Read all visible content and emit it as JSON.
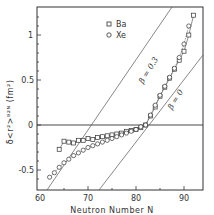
{
  "chart_data": {
    "type": "line",
    "title": "",
    "xlabel": "Neutron Number  N",
    "ylabel": "δ<r²>⁸²ᴺ (fm²)",
    "xlim": [
      60,
      95
    ],
    "ylim": [
      -0.7,
      1.35
    ],
    "x_ticks": [
      60,
      70,
      80,
      90
    ],
    "y_ticks": [
      -0.5,
      0,
      0.5,
      1
    ],
    "x_tick_labels": [
      "60",
      "70",
      "80",
      "90"
    ],
    "y_tick_labels": [
      "-0.5",
      "0",
      "0.5",
      "1"
    ],
    "grid": false,
    "legend_position": "upper left",
    "series": [
      {
        "name": "Ba",
        "marker": "square",
        "x": [
          64,
          65,
          66,
          67,
          68,
          69,
          70,
          71,
          72,
          73,
          74,
          75,
          76,
          77,
          78,
          79,
          80,
          81,
          82,
          83,
          84,
          85,
          86,
          87,
          88,
          89,
          90,
          91,
          92
        ],
        "values": [
          -0.27,
          -0.18,
          -0.19,
          -0.2,
          -0.17,
          -0.17,
          -0.15,
          -0.16,
          -0.14,
          -0.13,
          -0.12,
          -0.11,
          -0.1,
          -0.09,
          -0.07,
          -0.06,
          -0.05,
          -0.03,
          0.0,
          0.1,
          0.2,
          0.32,
          0.42,
          0.52,
          0.62,
          0.72,
          0.82,
          1.0,
          1.22
        ]
      },
      {
        "name": "Xe",
        "marker": "circle",
        "x": [
          62,
          63,
          64,
          65,
          66,
          67,
          68,
          69,
          70,
          71,
          72,
          73,
          74,
          75,
          76,
          77,
          78,
          79,
          80,
          81,
          82,
          83,
          84,
          85,
          86,
          87,
          88,
          89,
          90,
          91
        ],
        "values": [
          -0.58,
          -0.53,
          -0.47,
          -0.42,
          -0.38,
          -0.34,
          -0.31,
          -0.28,
          -0.25,
          -0.23,
          -0.21,
          -0.19,
          -0.17,
          -0.15,
          -0.13,
          -0.11,
          -0.09,
          -0.07,
          -0.05,
          -0.02,
          0.0,
          0.11,
          0.22,
          0.33,
          0.43,
          0.53,
          0.63,
          0.75,
          0.9,
          1.1
        ]
      }
    ],
    "reference_lines": [
      {
        "label": "β = 0.3",
        "x": [
          61.5,
          87.5
        ],
        "values": [
          -0.7,
          1.35
        ]
      },
      {
        "label": "β = 0",
        "x": [
          72.3,
          95
        ],
        "values": [
          -0.7,
          0.78
        ]
      },
      {
        "label": "zero",
        "x": [
          60,
          95
        ],
        "values": [
          0,
          0
        ]
      }
    ],
    "annotations": [
      "β = 0.3",
      "β = 0"
    ]
  },
  "legend": {
    "ba_label": "Ba",
    "xe_label": "Xe"
  },
  "axes": {
    "x_title": "Neutron Number  N",
    "y_title": "δ<r²>⁸²ᴺ (fm²)",
    "x_ticks": [
      "60",
      "70",
      "80",
      "90"
    ],
    "y_ticks": [
      "1",
      "0.5",
      "0",
      "-0.5"
    ]
  },
  "annotations": {
    "beta03": "β = 0.3",
    "beta0": "β = 0"
  }
}
